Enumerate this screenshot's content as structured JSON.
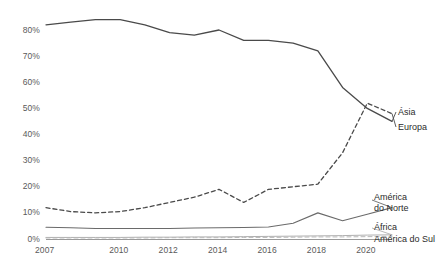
{
  "chart_data": {
    "type": "line",
    "title": "",
    "subtitle": "",
    "xlabel": "",
    "ylabel": "",
    "grid": false,
    "legend_position": "right-inline-labels",
    "x": [
      2007,
      2008,
      2009,
      2010,
      2011,
      2012,
      2013,
      2014,
      2015,
      2016,
      2017,
      2018,
      2019,
      2020,
      2021
    ],
    "xlim": [
      2007,
      2021
    ],
    "ylim": [
      0,
      80
    ],
    "xticks": [
      "2007",
      "2010",
      "2012",
      "2014",
      "2016",
      "2018",
      "2020"
    ],
    "xtick_values": [
      2007,
      2010,
      2012,
      2014,
      2016,
      2018,
      2020
    ],
    "yticks": [
      "0%",
      "10%",
      "20%",
      "30%",
      "40%",
      "50%",
      "60%",
      "70%",
      "80%"
    ],
    "ytick_values": [
      0,
      10,
      20,
      30,
      40,
      50,
      60,
      70,
      80
    ],
    "series": [
      {
        "name": "Ásia",
        "style": "solid",
        "color": "#4a4a4a",
        "width": 1.3,
        "values": [
          82,
          83,
          84,
          84,
          82,
          79,
          78,
          80,
          76,
          76,
          75,
          72,
          58,
          50,
          45
        ]
      },
      {
        "name": "Europa",
        "style": "dashed",
        "color": "#4a4a4a",
        "width": 1.3,
        "values": [
          12,
          10.5,
          10,
          10.5,
          12,
          14,
          16,
          19,
          14,
          19,
          20,
          21,
          33,
          52,
          48
        ]
      },
      {
        "name": "América do Norte",
        "style": "solid",
        "color": "#6a6a6a",
        "width": 1.1,
        "values": [
          4.5,
          4.3,
          4,
          4,
          4,
          4,
          4.2,
          4.3,
          4.4,
          4.6,
          6,
          10,
          7,
          9.5,
          12
        ]
      },
      {
        "name": "África",
        "style": "solid",
        "color": "#b0b0b0",
        "width": 1.0,
        "values": [
          0.6,
          0.6,
          0.6,
          0.6,
          0.7,
          0.7,
          0.8,
          0.8,
          0.9,
          1.0,
          1.1,
          1.2,
          1.3,
          1.5,
          1.6
        ]
      },
      {
        "name": "América do Sul",
        "style": "dashed",
        "color": "#b8b8b8",
        "width": 1.0,
        "values": [
          0.4,
          0.4,
          0.4,
          0.4,
          0.4,
          0.5,
          0.5,
          0.5,
          0.6,
          0.6,
          0.7,
          0.8,
          0.8,
          0.9,
          1.0
        ]
      }
    ],
    "inline_labels": [
      {
        "text": "Ásia",
        "series": "Ásia"
      },
      {
        "text": "Europa",
        "series": "Europa"
      },
      {
        "text": "América",
        "series": "América do Norte"
      },
      {
        "text": "do Norte",
        "series": "América do Norte"
      },
      {
        "text": "África",
        "series": "África"
      },
      {
        "text": "América do Sul",
        "series": "América do Sul"
      }
    ]
  },
  "axis": {
    "baseline_color": "#9a9a9a",
    "tick_text_color": "#5a5a5a"
  }
}
